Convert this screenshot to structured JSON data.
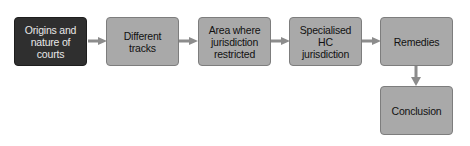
{
  "diagram": {
    "type": "flowchart",
    "colors": {
      "highlight_fill": "#2f2f2f",
      "highlight_text": "#e8e8e8",
      "node_fill": "#a9a9a9",
      "node_border": "#7d7d7d",
      "node_text": "#111111",
      "arrow": "#8c8c8c"
    },
    "nodes": [
      {
        "id": "origins",
        "label": "Origins and nature of courts",
        "highlighted": true
      },
      {
        "id": "tracks",
        "label": "Different tracks",
        "highlighted": false
      },
      {
        "id": "restricted",
        "label": "Area where jurisdiction restricted",
        "highlighted": false
      },
      {
        "id": "specialised",
        "label": "Specialised HC jurisdiction",
        "highlighted": false
      },
      {
        "id": "remedies",
        "label": "Remedies",
        "highlighted": false
      },
      {
        "id": "conclusion",
        "label": "Conclusion",
        "highlighted": false
      }
    ],
    "edges": [
      {
        "from": "origins",
        "to": "tracks"
      },
      {
        "from": "tracks",
        "to": "restricted"
      },
      {
        "from": "restricted",
        "to": "specialised"
      },
      {
        "from": "specialised",
        "to": "remedies"
      },
      {
        "from": "remedies",
        "to": "conclusion"
      }
    ]
  }
}
